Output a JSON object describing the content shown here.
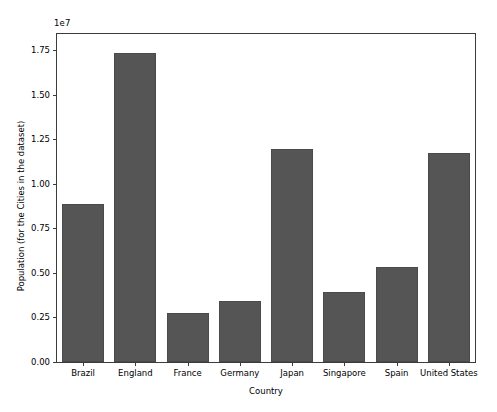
{
  "chart_data": {
    "type": "bar",
    "title": "",
    "xlabel": "Country",
    "ylabel": "Population (for the Cities in the dataset)",
    "y_offset_text": "1e7",
    "y_scale": 10000000,
    "ylim": [
      0,
      18400000
    ],
    "grid": false,
    "legend": null,
    "bar_color": "#555555",
    "bar_edge_color": "#4a4a4a",
    "categories": [
      "Brazil",
      "England",
      "France",
      "Germany",
      "Japan",
      "Singapore",
      "Spain",
      "United States"
    ],
    "values": [
      8850000,
      17350000,
      2750000,
      3450000,
      11950000,
      3900000,
      5350000,
      11750000
    ],
    "ytick_values": [
      0,
      2500000,
      5000000,
      7500000,
      10000000,
      12500000,
      15000000,
      17500000
    ],
    "ytick_labels": [
      "0.00",
      "0.25",
      "0.50",
      "0.75",
      "1.00",
      "1.25",
      "1.50",
      "1.75"
    ]
  }
}
